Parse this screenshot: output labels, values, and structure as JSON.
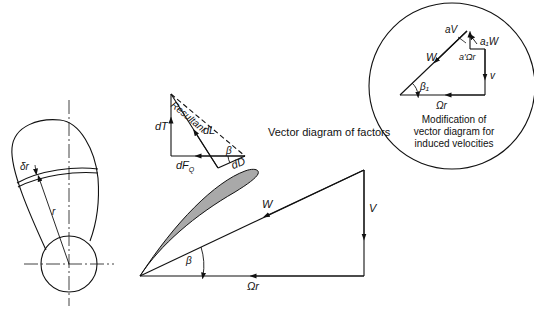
{
  "title": "Vector diagram of factors",
  "blade_view": {
    "labels": {
      "delta_r": "δr",
      "r": "r"
    }
  },
  "force_diagram": {
    "labels": {
      "resultant": "Resultant",
      "dT": "dT",
      "dL": "dL",
      "dFQ": "dF",
      "dFQ_sub": "Q",
      "dD": "dD",
      "beta": "β"
    }
  },
  "velocity_diagram": {
    "labels": {
      "W": "W",
      "V": "V",
      "omega_r": "Ωr",
      "beta": "β"
    }
  },
  "inset": {
    "caption_lines": [
      "Modification of",
      "vector diagram for",
      "induced velocities"
    ],
    "labels": {
      "aV": "aV",
      "a1W": "a₁W",
      "a_prime_omega_r": "a′Ωr",
      "W": "W",
      "v": "v",
      "beta1": "β₁",
      "omega_r": "Ωr"
    }
  },
  "colors": {
    "line": "#111111",
    "airfoil_fill": "#a9a9a9",
    "background": "#ffffff"
  }
}
